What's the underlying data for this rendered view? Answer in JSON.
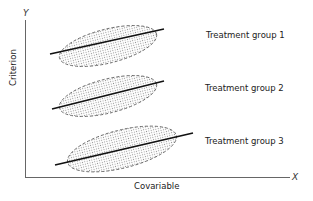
{
  "figure": {
    "axes": {
      "x_letter": "X",
      "y_letter": "Y",
      "xlabel": "Covariable",
      "ylabel": "Criterion"
    },
    "groups": [
      {
        "label": "Treatment group 1"
      },
      {
        "label": "Treatment group 2"
      },
      {
        "label": "Treatment group 3"
      }
    ]
  }
}
